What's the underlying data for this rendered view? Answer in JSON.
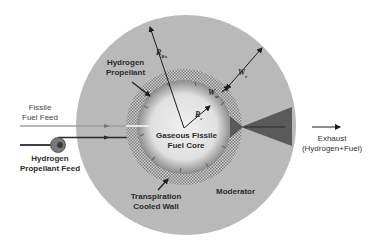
{
  "labels": {
    "hydrogen_propellant": [
      "Hydrogen",
      "Propellant"
    ],
    "fissile_fuel_feed": [
      "Fissile",
      "Fuel Feed"
    ],
    "hydrogen_propellant_feed": [
      "Hydrogen",
      "Propellant Feed"
    ],
    "gaseous_fissile_fuel_core": [
      "Gaseous Fissile",
      "Fuel Core"
    ],
    "transpiration_cooled_wall": [
      "Transpiration",
      "Cooled Wall"
    ],
    "moderator": "Moderator",
    "exhaust": [
      "Exhaust",
      "(Hydrogen+Fuel)"
    ]
  },
  "symbols": {
    "reflector_radius": {
      "main": "R",
      "sub": "Rx"
    },
    "core_radius": {
      "main": "R",
      "sub": "c"
    },
    "wall_thickness": {
      "main": "W",
      "sub": "w"
    },
    "moderator_thickness": {
      "main": "W",
      "sub": "r"
    }
  },
  "colors": {
    "moderator": "#b9b9b9",
    "wall_hatch_light": "#d6d6d6",
    "wall_hatch_dark": "#7a7a7a",
    "core_center": "#f2f2f2",
    "core_edge": "#8a8a8a",
    "nozzle": "#5a5a5a",
    "lines": "#1e1e1e",
    "fuel_feed_line": "#9a9a9a"
  }
}
